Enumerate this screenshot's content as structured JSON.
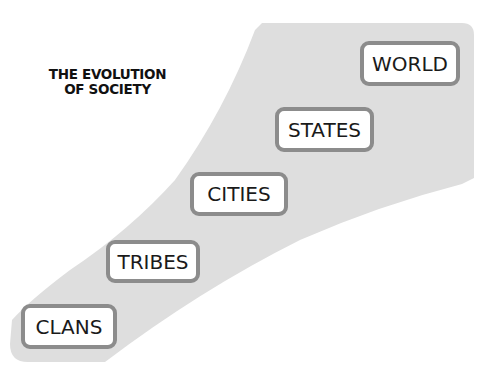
{
  "title": {
    "line1": "THE EVOLUTION",
    "line2": "OF SOCIETY"
  },
  "stages": [
    {
      "label": "CLANS",
      "order": 1
    },
    {
      "label": "TRIBES",
      "order": 2
    },
    {
      "label": "CITIES",
      "order": 3
    },
    {
      "label": "STATES",
      "order": 4
    },
    {
      "label": "WORLD",
      "order": 5
    }
  ],
  "colors": {
    "shape_fill": "#dedede",
    "box_border": "#8c8c8c",
    "box_fill": "#ffffff",
    "text": "#1a1a1a"
  }
}
